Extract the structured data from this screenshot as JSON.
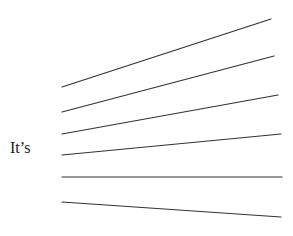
{
  "prompt": {
    "stem_text": "It’s"
  },
  "answer_lines": {
    "count": 6,
    "color": "#333333",
    "stroke_width": 1.2,
    "items": [
      {
        "x1": 62,
        "y1": 87,
        "x2": 271,
        "y2": 19
      },
      {
        "x1": 62,
        "y1": 112,
        "x2": 274,
        "y2": 56
      },
      {
        "x1": 62,
        "y1": 134,
        "x2": 278,
        "y2": 95
      },
      {
        "x1": 62,
        "y1": 155,
        "x2": 281,
        "y2": 134
      },
      {
        "x1": 62,
        "y1": 177,
        "x2": 282,
        "y2": 177
      },
      {
        "x1": 62,
        "y1": 202,
        "x2": 281,
        "y2": 217
      }
    ]
  }
}
